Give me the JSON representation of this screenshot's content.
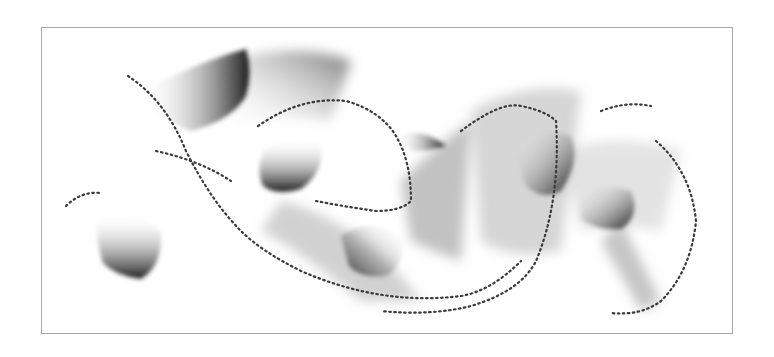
{
  "image": {
    "kind": "abstract-captcha-art",
    "frame": {
      "border_color": "#a8a8a8",
      "background": "#ffffff"
    },
    "colors": {
      "dark": "#1e1e1e",
      "mid": "#8a8a8a",
      "light": "#ffffff",
      "dots": "#3a3a3a"
    },
    "blob_count": 9,
    "dot_trail_count": 5
  }
}
